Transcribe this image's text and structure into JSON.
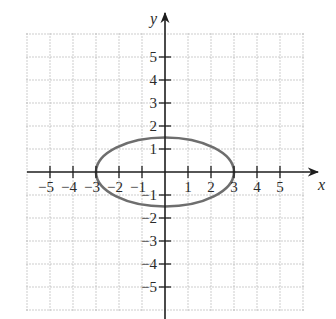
{
  "chart_data": {
    "type": "line",
    "title": "",
    "xlabel": "x",
    "ylabel": "y",
    "xlim": [
      -6,
      6
    ],
    "ylim": [
      -6,
      6
    ],
    "grid": true,
    "x_ticks": [
      -5,
      -4,
      -3,
      -2,
      -1,
      1,
      2,
      3,
      4,
      5
    ],
    "y_ticks": [
      -5,
      -4,
      -3,
      -2,
      -1,
      1,
      2,
      3,
      4,
      5
    ],
    "series": [
      {
        "name": "ellipse",
        "shape": "ellipse",
        "center": [
          0,
          0
        ],
        "semi_axis_x": 3,
        "semi_axis_y": 1.5,
        "color": "#6e6e6e",
        "x_intercepts": [
          -3,
          3
        ],
        "y_intercepts": [
          -1.5,
          1.5
        ]
      }
    ]
  },
  "axes": {
    "x_label": "x",
    "y_label": "y",
    "axis_color": "#1e1e1e",
    "grid_color": "#9a9a9a",
    "curve_color": "#6e6e6e"
  },
  "layout": {
    "origin_px": [
      165,
      172
    ],
    "unit_px": 23
  }
}
